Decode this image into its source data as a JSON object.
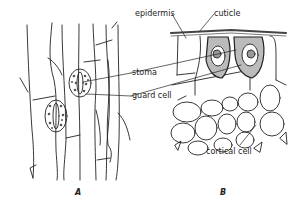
{
  "figure": {
    "panels": [
      {
        "id": "A",
        "label": "A",
        "description": "surface view of epidermis with stomata"
      },
      {
        "id": "B",
        "label": "B",
        "description": "cross section of epidermis and cortex"
      }
    ],
    "labels": {
      "epidermis": "epidermis",
      "cuticle": "cuticle",
      "stoma": "stoma",
      "guard_cell": "guard cell",
      "cortical_cell": "cortical cell"
    },
    "colors": {
      "line": "#222222",
      "background": "#ffffff"
    }
  }
}
